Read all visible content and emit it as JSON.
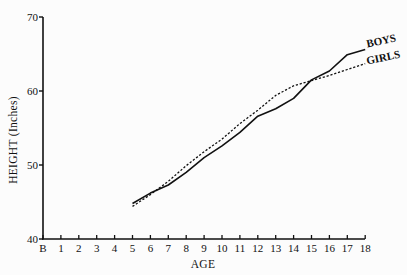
{
  "chart_data": {
    "type": "line",
    "title": "",
    "xlabel": "AGE",
    "ylabel": "HEIGHT (Inches)",
    "x_tick_labels": [
      "B",
      "1",
      "2",
      "3",
      "4",
      "5",
      "6",
      "7",
      "8",
      "9",
      "10",
      "11",
      "12",
      "13",
      "14",
      "15",
      "16",
      "17",
      "18"
    ],
    "y_ticks": [
      40,
      50,
      60,
      70
    ],
    "xlim": [
      0,
      18
    ],
    "ylim": [
      40,
      70
    ],
    "grid": false,
    "legend_position": "inline labels at right end of lines",
    "x": [
      5,
      6,
      7,
      8,
      9,
      10,
      11,
      12,
      13,
      14,
      15,
      16,
      17,
      18
    ],
    "series": [
      {
        "name": "BOYS",
        "style": "solid",
        "values": [
          44.8,
          46.2,
          47.3,
          49.0,
          51.0,
          52.6,
          54.4,
          56.6,
          57.6,
          59.0,
          61.5,
          62.7,
          64.9,
          65.6
        ]
      },
      {
        "name": "GIRLS",
        "style": "dashed",
        "values": [
          44.4,
          46.0,
          47.8,
          49.9,
          51.8,
          53.5,
          55.6,
          57.4,
          59.4,
          60.7,
          61.4,
          62.1,
          62.9,
          63.7
        ]
      }
    ]
  }
}
